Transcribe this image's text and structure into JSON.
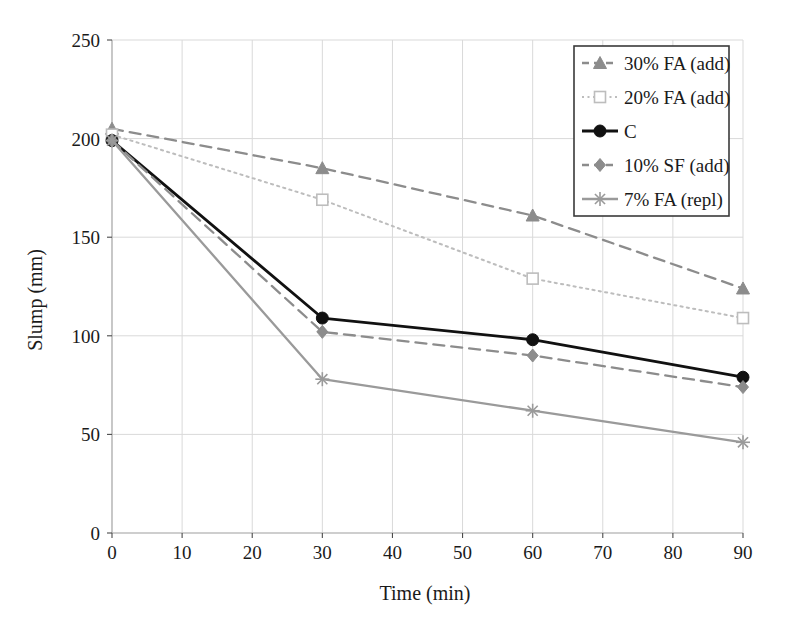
{
  "chart_data": {
    "type": "line",
    "title": "",
    "xlabel": "Time (min)",
    "ylabel": "Slump (mm)",
    "xlim": [
      0,
      90
    ],
    "ylim": [
      0,
      250
    ],
    "x": [
      0,
      30,
      60,
      90
    ],
    "xticks": [
      0,
      10,
      20,
      30,
      40,
      50,
      60,
      70,
      80,
      90
    ],
    "yticks": [
      0,
      50,
      100,
      150,
      200,
      250
    ],
    "grid": true,
    "legend_position": "top-right",
    "series": [
      {
        "name": "30% FA (add)",
        "values": [
          205,
          185,
          161,
          124
        ],
        "color": "#8c8c8c",
        "line_style": "dashed",
        "marker": "triangle"
      },
      {
        "name": "20% FA (add)",
        "values": [
          202,
          169,
          129,
          109
        ],
        "color": "#bdbdbd",
        "line_style": "dotted",
        "marker": "square"
      },
      {
        "name": "C",
        "values": [
          199,
          109,
          98,
          79
        ],
        "color": "#111111",
        "line_style": "solid",
        "marker": "circle"
      },
      {
        "name": "10% SF (add)",
        "values": [
          199,
          102,
          90,
          74
        ],
        "color": "#8c8c8c",
        "line_style": "dashed",
        "marker": "diamond"
      },
      {
        "name": "7% FA (repl)",
        "values": [
          199,
          78,
          62,
          46
        ],
        "color": "#9a9a9a",
        "line_style": "solid",
        "marker": "star"
      }
    ]
  },
  "axes": {
    "x_tick_labels": [
      "0",
      "10",
      "20",
      "30",
      "40",
      "50",
      "60",
      "70",
      "80",
      "90"
    ],
    "y_tick_labels": [
      "0",
      "50",
      "100",
      "150",
      "200",
      "250"
    ],
    "x_axis_title": "Time (min)",
    "y_axis_title": "Slump (mm)"
  },
  "legend": {
    "entries": [
      {
        "label": "30% FA (add)"
      },
      {
        "label": "20% FA (add)"
      },
      {
        "label": "C"
      },
      {
        "label": "10% SF (add)"
      },
      {
        "label": "7% FA (repl)"
      }
    ]
  },
  "style": {
    "grid_color": "#d9d9d9",
    "frame_color": "#b0b0b0",
    "legend_border_color": "#3a3a3a",
    "background": "#ffffff"
  }
}
